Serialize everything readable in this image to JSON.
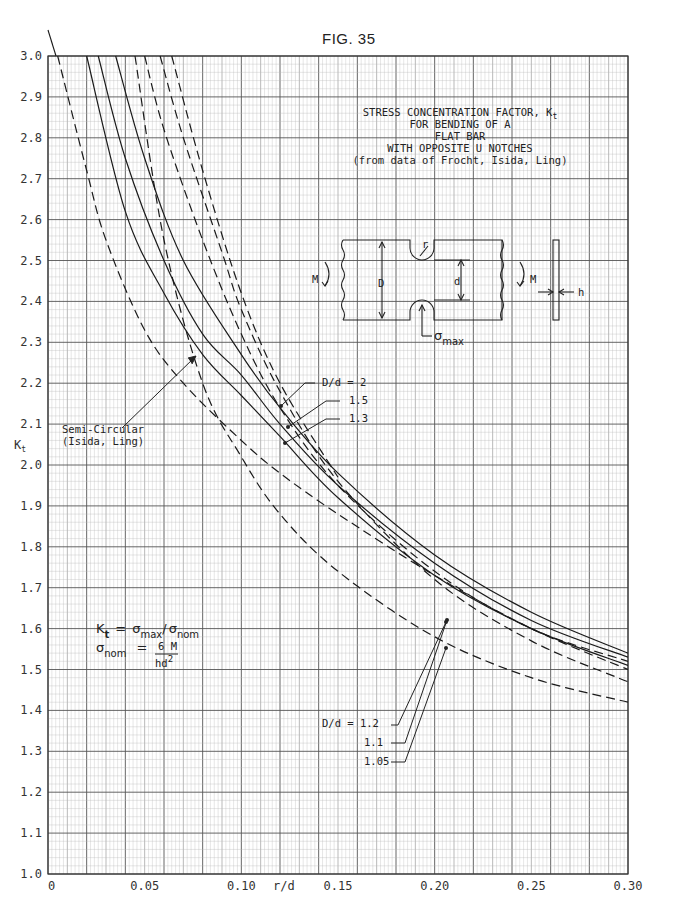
{
  "figure": {
    "label": "FIG. 35",
    "title_lines": [
      "STRESS CONCENTRATION FACTOR, K",
      "FOR BENDING OF A",
      "FLAT BAR",
      "WITH OPPOSITE U NOTCHES",
      "(from data of Frocht, Isida, Ling)"
    ],
    "title_subscript": "t"
  },
  "annotations": {
    "semi_circular": [
      "Semi-Circular",
      "(Isida, Ling)"
    ],
    "dd_top": [
      "D/d = 2",
      "1.5",
      "1.3"
    ],
    "dd_bottom": [
      "D/d = 1.2",
      "1.1",
      "1.05"
    ],
    "formula_kt": {
      "lhs": "K",
      "lhs_sub": "t",
      "eq": "=",
      "num": "σ",
      "num_sub": "max",
      "slash": "/",
      "den": "σ",
      "den_sub": "nom"
    },
    "formula_nom": {
      "lhs": "σ",
      "lhs_sub": "nom",
      "eq": "=",
      "frac_num": "6 M",
      "frac_den": "hd",
      "frac_den_sup": "2"
    },
    "diagram": {
      "D": "D",
      "d": "d",
      "r": "r",
      "M_left": "M",
      "M_right": "M",
      "h": "h",
      "sigma": "σ",
      "sigma_sub": "max"
    }
  },
  "chart_data": {
    "type": "line",
    "xlabel": "r/d",
    "ylabel": "Kt",
    "xlim": [
      0,
      0.3
    ],
    "ylim": [
      1.0,
      3.0
    ],
    "grid": true,
    "x_ticks": [
      "0",
      "0.05",
      "0.10",
      "0.15",
      "0.20",
      "0.25",
      "0.30"
    ],
    "y_ticks": [
      "1.0",
      "1.1",
      "1.2",
      "1.3",
      "1.4",
      "1.5",
      "1.6",
      "1.7",
      "1.8",
      "1.9",
      "2.0",
      "2.1",
      "2.2",
      "2.3",
      "2.4",
      "2.5",
      "2.6",
      "2.7",
      "2.8",
      "2.9",
      "3.0"
    ],
    "series": [
      {
        "name": "D/d = 2",
        "style": "solid",
        "x": [
          0.035,
          0.05,
          0.07,
          0.1,
          0.12,
          0.15,
          0.2,
          0.25,
          0.3
        ],
        "y": [
          3.0,
          2.75,
          2.5,
          2.27,
          2.14,
          1.98,
          1.78,
          1.64,
          1.54
        ]
      },
      {
        "name": "D/d = 1.5",
        "style": "solid",
        "x": [
          0.026,
          0.04,
          0.06,
          0.08,
          0.1,
          0.12,
          0.15,
          0.2,
          0.25,
          0.3
        ],
        "y": [
          3.0,
          2.75,
          2.5,
          2.32,
          2.22,
          2.1,
          1.95,
          1.76,
          1.62,
          1.53
        ]
      },
      {
        "name": "D/d = 1.3",
        "style": "solid",
        "x": [
          0.02,
          0.04,
          0.06,
          0.08,
          0.1,
          0.12,
          0.15,
          0.2,
          0.25,
          0.3
        ],
        "y": [
          3.0,
          2.62,
          2.42,
          2.27,
          2.17,
          2.07,
          1.92,
          1.73,
          1.6,
          1.51
        ]
      },
      {
        "name": "D/d = 1.2",
        "style": "dashed",
        "x": [
          0.05,
          0.06,
          0.08,
          0.1,
          0.12,
          0.15,
          0.2,
          0.25,
          0.3
        ],
        "y": [
          3.0,
          2.82,
          2.55,
          2.32,
          2.14,
          1.95,
          1.74,
          1.6,
          1.52
        ]
      },
      {
        "name": "D/d = 1.1",
        "style": "dashed",
        "x": [
          0.058,
          0.07,
          0.09,
          0.1,
          0.12,
          0.15,
          0.2,
          0.25,
          0.3
        ],
        "y": [
          3.0,
          2.8,
          2.52,
          2.38,
          2.18,
          1.96,
          1.72,
          1.57,
          1.47
        ]
      },
      {
        "name": "D/d = 1.05",
        "style": "dashed",
        "x": [
          0.045,
          0.06,
          0.08,
          0.1,
          0.12,
          0.15,
          0.2,
          0.25,
          0.3
        ],
        "y": [
          3.0,
          2.55,
          2.2,
          2.02,
          1.88,
          1.74,
          1.58,
          1.48,
          1.42
        ]
      },
      {
        "name": "Semi-Circular (Isida, Ling)",
        "style": "dashed",
        "x": [
          0.005,
          0.02,
          0.03,
          0.05,
          0.07,
          0.1,
          0.12,
          0.15,
          0.2,
          0.25,
          0.3
        ],
        "y": [
          3.0,
          2.72,
          2.55,
          2.33,
          2.2,
          2.06,
          1.98,
          1.88,
          1.73,
          1.6,
          1.5
        ]
      },
      {
        "name": "D/d = 2 (dashed companion)",
        "style": "dashed",
        "x": [
          0.064,
          0.08,
          0.1,
          0.12,
          0.15
        ],
        "y": [
          3.0,
          2.72,
          2.42,
          2.2,
          1.97
        ]
      }
    ]
  }
}
